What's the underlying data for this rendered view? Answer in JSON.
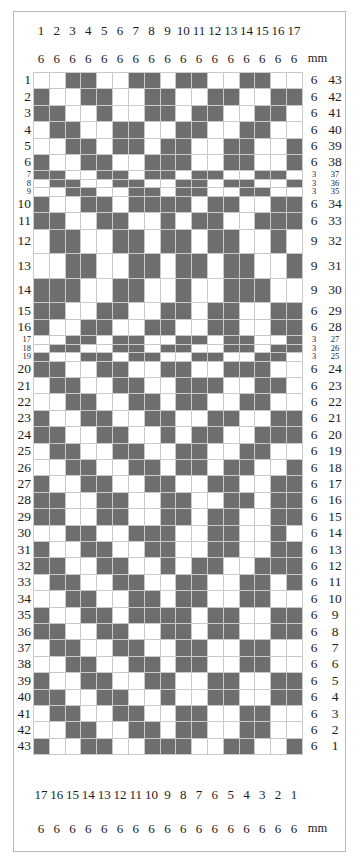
{
  "chart_data": {
    "type": "heatmap",
    "xlabel": "",
    "ylabel": "",
    "grid": true,
    "legend_position": "none",
    "columns": 17,
    "rows": 43,
    "colors": {
      "filled": "#6e6e6e",
      "empty": "#ffffff",
      "gridline": "#c9c9cd",
      "border": "#b9b9bd"
    },
    "unit_label": "mm",
    "top_column_numbers": [
      "1",
      "2",
      "3",
      "4",
      "5",
      "6",
      "7",
      "8",
      "9",
      "10",
      "11",
      "12",
      "13",
      "14",
      "15",
      "16",
      "17"
    ],
    "top_column_widths": [
      "6",
      "6",
      "6",
      "6",
      "6",
      "6",
      "6",
      "6",
      "6",
      "6",
      "6",
      "6",
      "6",
      "6",
      "6",
      "6",
      "6"
    ],
    "bottom_column_numbers": [
      "17",
      "16",
      "15",
      "14",
      "13",
      "12",
      "11",
      "10",
      "9",
      "8",
      "7",
      "6",
      "5",
      "4",
      "3",
      "2",
      "1"
    ],
    "bottom_column_widths": [
      "6",
      "6",
      "6",
      "6",
      "6",
      "6",
      "6",
      "6",
      "6",
      "6",
      "6",
      "6",
      "6",
      "6",
      "6",
      "6",
      "6"
    ],
    "row_left_numbers": [
      "1",
      "2",
      "3",
      "4",
      "5",
      "6",
      "7",
      "8",
      "9",
      "10",
      "11",
      "12",
      "13",
      "14",
      "15",
      "16",
      "17",
      "18",
      "19",
      "20",
      "21",
      "22",
      "23",
      "24",
      "25",
      "26",
      "27",
      "28",
      "29",
      "30",
      "31",
      "32",
      "33",
      "34",
      "35",
      "36",
      "37",
      "38",
      "39",
      "40",
      "41",
      "42",
      "43"
    ],
    "row_heights_mm": [
      "6",
      "6",
      "6",
      "6",
      "6",
      "6",
      "3",
      "3",
      "3",
      "6",
      "6",
      "9",
      "9",
      "9",
      "6",
      "6",
      "3",
      "3",
      "3",
      "6",
      "6",
      "6",
      "6",
      "6",
      "6",
      "6",
      "6",
      "6",
      "6",
      "6",
      "6",
      "6",
      "6",
      "6",
      "6",
      "6",
      "6",
      "6",
      "6",
      "6",
      "6",
      "6",
      "6"
    ],
    "row_right_numbers": [
      "43",
      "42",
      "41",
      "40",
      "39",
      "38",
      "37",
      "36",
      "35",
      "34",
      "33",
      "32",
      "31",
      "30",
      "29",
      "28",
      "27",
      "26",
      "25",
      "24",
      "23",
      "22",
      "21",
      "20",
      "19",
      "18",
      "17",
      "16",
      "15",
      "14",
      "13",
      "12",
      "11",
      "10",
      "9",
      "8",
      "7",
      "6",
      "5",
      "4",
      "3",
      "2",
      "1"
    ],
    "matrix": [
      [
        0,
        0,
        1,
        1,
        0,
        0,
        1,
        1,
        0,
        1,
        1,
        0,
        0,
        1,
        1,
        0,
        0
      ],
      [
        1,
        0,
        0,
        1,
        1,
        0,
        0,
        1,
        1,
        0,
        0,
        1,
        1,
        0,
        0,
        1,
        1
      ],
      [
        1,
        1,
        0,
        0,
        1,
        0,
        0,
        1,
        1,
        0,
        1,
        1,
        0,
        0,
        1,
        1,
        0
      ],
      [
        0,
        1,
        1,
        0,
        0,
        1,
        1,
        0,
        0,
        1,
        1,
        0,
        0,
        1,
        1,
        0,
        0
      ],
      [
        0,
        0,
        1,
        1,
        0,
        1,
        1,
        0,
        1,
        1,
        0,
        0,
        1,
        1,
        0,
        0,
        1
      ],
      [
        1,
        0,
        0,
        1,
        1,
        0,
        0,
        1,
        1,
        1,
        0,
        0,
        1,
        1,
        0,
        0,
        1
      ],
      [
        1,
        1,
        0,
        0,
        1,
        1,
        0,
        1,
        1,
        0,
        1,
        1,
        0,
        0,
        1,
        1,
        0
      ],
      [
        0,
        1,
        1,
        0,
        0,
        1,
        1,
        0,
        0,
        1,
        1,
        0,
        1,
        1,
        0,
        0,
        1
      ],
      [
        0,
        0,
        1,
        1,
        0,
        0,
        1,
        1,
        0,
        1,
        1,
        0,
        0,
        1,
        1,
        0,
        0
      ],
      [
        1,
        0,
        0,
        1,
        1,
        0,
        1,
        1,
        1,
        1,
        0,
        1,
        1,
        0,
        0,
        1,
        1
      ],
      [
        1,
        1,
        0,
        0,
        1,
        1,
        0,
        0,
        1,
        0,
        1,
        1,
        0,
        0,
        1,
        1,
        1
      ],
      [
        0,
        1,
        1,
        0,
        0,
        1,
        1,
        0,
        1,
        1,
        0,
        1,
        1,
        0,
        0,
        1,
        0
      ],
      [
        0,
        0,
        1,
        1,
        0,
        0,
        1,
        1,
        0,
        1,
        1,
        0,
        1,
        1,
        0,
        0,
        1
      ],
      [
        1,
        1,
        1,
        0,
        0,
        1,
        1,
        0,
        0,
        1,
        0,
        0,
        1,
        1,
        1,
        0,
        0
      ],
      [
        1,
        1,
        0,
        0,
        1,
        1,
        0,
        0,
        1,
        1,
        0,
        1,
        1,
        0,
        0,
        1,
        1
      ],
      [
        1,
        0,
        0,
        1,
        1,
        0,
        0,
        1,
        1,
        0,
        0,
        1,
        1,
        0,
        0,
        1,
        1
      ],
      [
        0,
        0,
        1,
        1,
        0,
        1,
        1,
        0,
        0,
        1,
        1,
        0,
        1,
        1,
        0,
        0,
        1
      ],
      [
        0,
        1,
        1,
        0,
        0,
        1,
        1,
        0,
        1,
        1,
        0,
        0,
        1,
        1,
        0,
        1,
        1
      ],
      [
        1,
        0,
        0,
        1,
        1,
        0,
        1,
        1,
        0,
        0,
        1,
        1,
        0,
        0,
        1,
        1,
        0
      ],
      [
        1,
        1,
        0,
        0,
        1,
        1,
        0,
        0,
        1,
        1,
        0,
        0,
        1,
        1,
        1,
        0,
        0
      ],
      [
        0,
        1,
        1,
        0,
        0,
        1,
        1,
        0,
        0,
        1,
        1,
        1,
        0,
        0,
        1,
        1,
        0
      ],
      [
        0,
        0,
        1,
        1,
        0,
        0,
        1,
        1,
        0,
        1,
        1,
        0,
        0,
        1,
        1,
        0,
        0
      ],
      [
        1,
        0,
        0,
        1,
        1,
        0,
        0,
        1,
        1,
        0,
        0,
        1,
        1,
        0,
        0,
        1,
        1
      ],
      [
        1,
        1,
        0,
        0,
        1,
        1,
        0,
        0,
        1,
        0,
        1,
        1,
        0,
        0,
        1,
        1,
        1
      ],
      [
        0,
        1,
        1,
        0,
        0,
        1,
        1,
        0,
        0,
        1,
        1,
        0,
        0,
        1,
        1,
        0,
        0
      ],
      [
        0,
        0,
        1,
        1,
        0,
        0,
        1,
        1,
        0,
        1,
        1,
        0,
        1,
        1,
        0,
        0,
        1
      ],
      [
        1,
        0,
        0,
        1,
        1,
        0,
        0,
        1,
        1,
        0,
        0,
        1,
        1,
        0,
        0,
        1,
        1
      ],
      [
        1,
        1,
        0,
        0,
        1,
        1,
        0,
        0,
        1,
        1,
        0,
        0,
        1,
        1,
        0,
        1,
        1
      ],
      [
        1,
        1,
        0,
        0,
        1,
        1,
        0,
        0,
        1,
        1,
        0,
        1,
        1,
        0,
        0,
        1,
        1
      ],
      [
        0,
        0,
        1,
        1,
        0,
        0,
        1,
        1,
        1,
        0,
        0,
        1,
        1,
        0,
        0,
        1,
        0
      ],
      [
        1,
        0,
        0,
        1,
        1,
        0,
        0,
        1,
        1,
        0,
        0,
        1,
        1,
        0,
        0,
        1,
        1
      ],
      [
        1,
        1,
        0,
        0,
        1,
        1,
        0,
        0,
        1,
        0,
        1,
        1,
        0,
        0,
        1,
        1,
        1
      ],
      [
        0,
        1,
        1,
        0,
        0,
        1,
        1,
        0,
        0,
        1,
        1,
        0,
        0,
        1,
        1,
        0,
        1
      ],
      [
        0,
        0,
        1,
        1,
        0,
        0,
        1,
        1,
        0,
        1,
        1,
        0,
        0,
        1,
        1,
        0,
        0
      ],
      [
        1,
        0,
        0,
        1,
        1,
        0,
        1,
        1,
        1,
        1,
        0,
        1,
        1,
        0,
        0,
        1,
        1
      ],
      [
        1,
        1,
        0,
        0,
        1,
        1,
        0,
        0,
        1,
        1,
        0,
        1,
        1,
        0,
        0,
        1,
        1
      ],
      [
        0,
        1,
        1,
        0,
        0,
        1,
        1,
        0,
        0,
        1,
        1,
        0,
        0,
        1,
        1,
        0,
        0
      ],
      [
        0,
        0,
        1,
        1,
        0,
        0,
        1,
        1,
        0,
        1,
        1,
        0,
        0,
        1,
        1,
        0,
        0
      ],
      [
        1,
        0,
        0,
        1,
        1,
        0,
        0,
        1,
        1,
        0,
        0,
        1,
        1,
        0,
        0,
        1,
        1
      ],
      [
        1,
        1,
        0,
        0,
        1,
        1,
        0,
        0,
        1,
        0,
        0,
        1,
        1,
        0,
        0,
        1,
        1
      ],
      [
        0,
        1,
        1,
        0,
        0,
        1,
        1,
        0,
        0,
        1,
        1,
        0,
        0,
        1,
        1,
        0,
        0
      ],
      [
        0,
        0,
        1,
        1,
        0,
        0,
        1,
        1,
        0,
        1,
        1,
        0,
        0,
        1,
        1,
        0,
        0
      ],
      [
        1,
        0,
        0,
        1,
        1,
        0,
        0,
        1,
        1,
        1,
        0,
        0,
        1,
        1,
        0,
        0,
        1
      ]
    ]
  }
}
